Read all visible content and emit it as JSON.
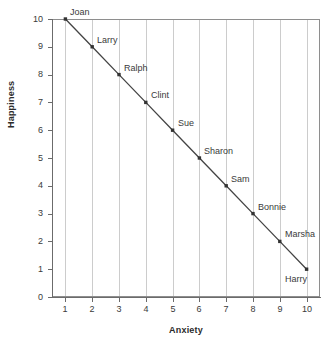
{
  "chart_data": {
    "type": "scatter",
    "title": "",
    "xlabel": "Anxiety",
    "ylabel": "Happiness",
    "xlim": [
      0.5,
      10.5
    ],
    "ylim": [
      0,
      10
    ],
    "xticks": [
      "1",
      "2",
      "3",
      "4",
      "5",
      "6",
      "7",
      "8",
      "9",
      "10"
    ],
    "yticks": [
      "0",
      "1",
      "2",
      "3",
      "4",
      "5",
      "6",
      "7",
      "8",
      "9",
      "10"
    ],
    "grid": "vertical",
    "legend": "none",
    "line_connected": true,
    "marker": "square",
    "marker_color": "#333333",
    "line_color": "#444444",
    "gridline_color": "#cccccc",
    "frame_color": "#8e8e8e",
    "x": [
      1,
      2,
      3,
      4,
      5,
      6,
      7,
      8,
      9,
      10
    ],
    "y": [
      10,
      9,
      8,
      7,
      6,
      5,
      4,
      3,
      2,
      1
    ],
    "point_labels": [
      "Joan",
      "Larry",
      "Ralph",
      "Clint",
      "Sue",
      "Sharon",
      "Sam",
      "Bonnie",
      "Marsha",
      "Harry"
    ],
    "points": [
      {
        "label": "Joan",
        "x": 1,
        "y": 10,
        "label_position": "upper-right"
      },
      {
        "label": "Larry",
        "x": 2,
        "y": 9,
        "label_position": "upper-right"
      },
      {
        "label": "Ralph",
        "x": 3,
        "y": 8,
        "label_position": "upper-right"
      },
      {
        "label": "Clint",
        "x": 4,
        "y": 7,
        "label_position": "upper-right"
      },
      {
        "label": "Sue",
        "x": 5,
        "y": 6,
        "label_position": "upper-right"
      },
      {
        "label": "Sharon",
        "x": 6,
        "y": 5,
        "label_position": "upper-right"
      },
      {
        "label": "Sam",
        "x": 7,
        "y": 4,
        "label_position": "upper-right"
      },
      {
        "label": "Bonnie",
        "x": 8,
        "y": 3,
        "label_position": "upper-right"
      },
      {
        "label": "Marsha",
        "x": 9,
        "y": 2,
        "label_position": "upper-right"
      },
      {
        "label": "Harry",
        "x": 10,
        "y": 1,
        "label_position": "lower-left"
      }
    ]
  }
}
